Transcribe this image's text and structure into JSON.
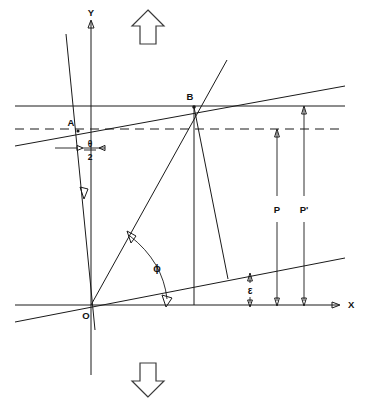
{
  "figure": {
    "background_color": "#ffffff",
    "line_color": "#1a1a1a",
    "width": 379,
    "height": 407
  },
  "axes": {
    "x_label": "X",
    "y_label": "Y",
    "origin_label": "O",
    "x_axis_y": 305,
    "y_axis_x": 91,
    "x_axis_start": 15,
    "x_axis_end": 338,
    "y_axis_top": 22,
    "y_axis_bottom": 375
  },
  "points": [
    {
      "name": "origin",
      "label": "O",
      "x": 91,
      "y": 305
    },
    {
      "name": "point-a",
      "label": "A",
      "x": 78,
      "y": 131
    },
    {
      "name": "point-b",
      "label": "B",
      "x": 194,
      "y": 107
    }
  ],
  "angles": [
    {
      "name": "half-theta",
      "label_numerator": "θ",
      "label_denominator": "2",
      "label_text": "θ/2"
    },
    {
      "name": "phi-angle",
      "label": "ϕ"
    },
    {
      "name": "epsilon-angle",
      "label": "ε"
    }
  ],
  "dimensions": [
    {
      "name": "dimension-p",
      "label": "P",
      "x": 277,
      "top_y": 129,
      "bottom_y": 305
    },
    {
      "name": "dimension-p-prime",
      "label": "P'",
      "x": 304,
      "top_y": 106,
      "bottom_y": 305
    }
  ],
  "markers": {
    "up_arrow": "up-arrow",
    "down_arrow": "down-arrow"
  },
  "lines": {
    "horizontal_solid_y": 106,
    "horizontal_dashed_y": 129,
    "inclined_upper": "line through A and B, slope rising to the right",
    "inclined_lower": "line through O rising to the right",
    "ray_ob": "ray from O to B",
    "vertical_b": "vertical drop from B to X-axis",
    "slant_b": "slanted line from B down to lower inclined line",
    "tilted_y": "tilted line through A and O"
  }
}
